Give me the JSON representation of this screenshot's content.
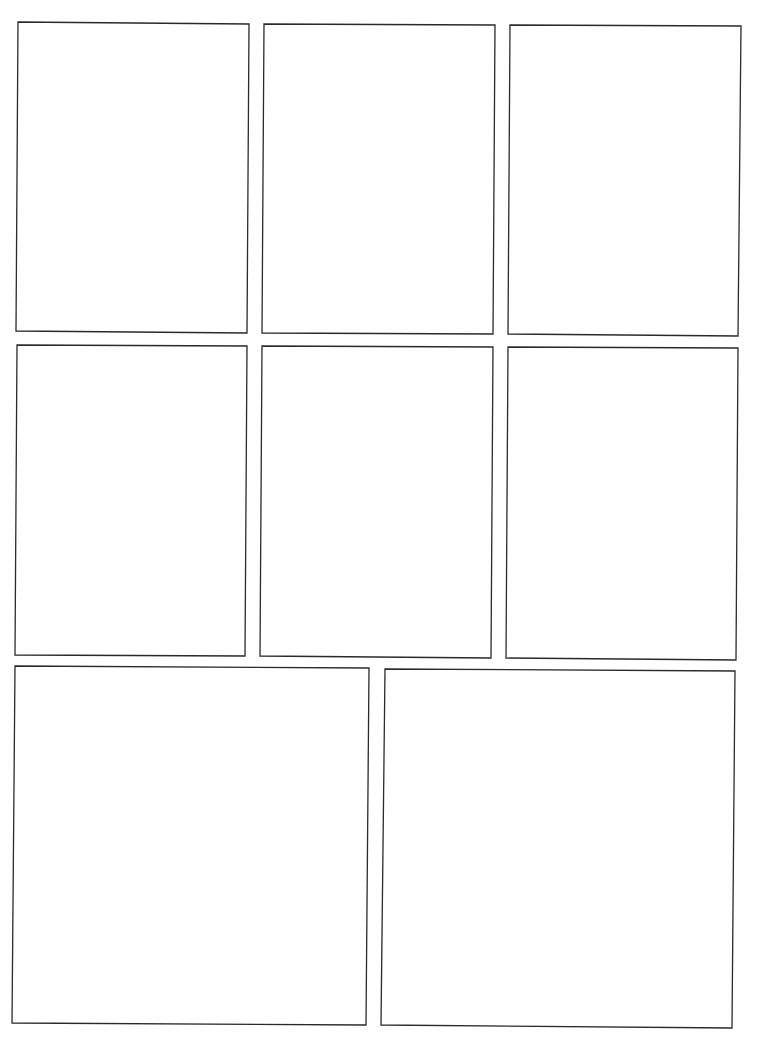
{
  "page": {
    "width": 767,
    "height": 1052,
    "background": "#ffffff",
    "border_color": "#2a2a2a",
    "border_width": 1.3
  },
  "panels": [
    {
      "id": 1,
      "row": 1,
      "pts": [
        [
          18,
          22
        ],
        [
          249,
          24
        ],
        [
          247,
          333
        ],
        [
          16,
          331
        ]
      ]
    },
    {
      "id": 2,
      "row": 1,
      "pts": [
        [
          264,
          24
        ],
        [
          495,
          25
        ],
        [
          493,
          334
        ],
        [
          262,
          333
        ]
      ]
    },
    {
      "id": 3,
      "row": 1,
      "pts": [
        [
          510,
          25
        ],
        [
          741,
          26
        ],
        [
          738,
          336
        ],
        [
          508,
          334
        ]
      ]
    },
    {
      "id": 4,
      "row": 2,
      "pts": [
        [
          17,
          345
        ],
        [
          247,
          346
        ],
        [
          245,
          656
        ],
        [
          15,
          655
        ]
      ]
    },
    {
      "id": 5,
      "row": 2,
      "pts": [
        [
          262,
          346
        ],
        [
          493,
          347
        ],
        [
          491,
          658
        ],
        [
          260,
          656
        ]
      ]
    },
    {
      "id": 6,
      "row": 2,
      "pts": [
        [
          508,
          347
        ],
        [
          738,
          348
        ],
        [
          736,
          660
        ],
        [
          506,
          658
        ]
      ]
    },
    {
      "id": 7,
      "row": 3,
      "pts": [
        [
          15,
          666
        ],
        [
          369,
          668
        ],
        [
          366,
          1025
        ],
        [
          12,
          1023
        ]
      ]
    },
    {
      "id": 8,
      "row": 3,
      "pts": [
        [
          385,
          669
        ],
        [
          735,
          671
        ],
        [
          732,
          1028
        ],
        [
          381,
          1025
        ]
      ]
    }
  ]
}
